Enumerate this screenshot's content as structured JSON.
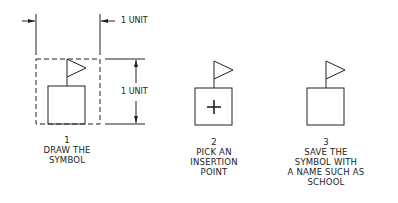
{
  "dimensions": {
    "horizontal_label": "1 UNIT",
    "vertical_label": "1 UNIT"
  },
  "steps": [
    {
      "number": "1",
      "caption_lines": [
        "DRAW THE",
        "SYMBOL"
      ]
    },
    {
      "number": "2",
      "caption_lines": [
        "PICK AN",
        "INSERTION",
        "POINT"
      ]
    },
    {
      "number": "3",
      "caption_lines": [
        "SAVE THE",
        "SYMBOL WITH",
        "A NAME SUCH AS",
        "SCHOOL"
      ]
    }
  ],
  "icons": [
    "flag-symbol-icon",
    "insertion-point-cross-icon"
  ],
  "colors": {
    "line": "#222222",
    "background": "#ffffff"
  }
}
